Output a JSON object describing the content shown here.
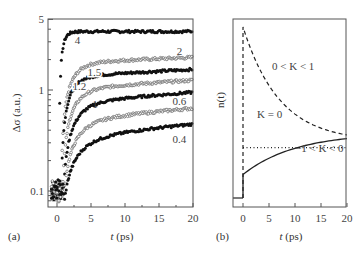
{
  "chart_data": [
    {
      "panel": "(a)",
      "type": "scatter",
      "xlabel": "t (ps)",
      "ylabel": "Δσ (a.u.)",
      "yscale": "log",
      "xlim": [
        -1,
        20
      ],
      "ylim": [
        0.07,
        5
      ],
      "xticks": [
        0,
        5,
        10,
        15,
        20
      ],
      "yticks": [
        {
          "value": 0.1,
          "label": "0.1"
        },
        {
          "value": 1,
          "label": "1"
        },
        {
          "value": 5,
          "label": "5"
        }
      ],
      "grid": false,
      "legend": "inline curve labels (pump fluence)",
      "series": [
        {
          "name": "4",
          "marker": "filled",
          "plateau": 3.8,
          "rise_tau": 0.5,
          "onset": 0.3,
          "label_pos": [
            3,
            3.1
          ]
        },
        {
          "name": "2",
          "marker": "open",
          "plateau": 2.1,
          "rise_tau": 1.6,
          "onset": 0.6,
          "slope": 0.006,
          "label_pos": [
            18,
            2.45
          ]
        },
        {
          "name": "1.5",
          "marker": "filled",
          "plateau": 1.6,
          "rise_tau": 1.4,
          "onset": 0.6,
          "slope": 0.008,
          "label_pos": [
            5.5,
            1.5
          ]
        },
        {
          "name": "1.2",
          "marker": "open",
          "plateau": 1.25,
          "rise_tau": 1.8,
          "onset": 0.8,
          "slope": 0.01,
          "label_pos": [
            3.3,
            1.1
          ]
        },
        {
          "name": "1",
          "marker": "filled",
          "plateau": 0.95,
          "rise_tau": 2.0,
          "onset": 0.9,
          "slope": 0.012,
          "label_pos": [
            5.6,
            0.72
          ]
        },
        {
          "name": "0.6",
          "marker": "open",
          "plateau": 0.66,
          "rise_tau": 2.2,
          "onset": 1.0,
          "slope": 0.014,
          "label_pos": [
            18,
            0.78
          ]
        },
        {
          "name": "0.4",
          "marker": "filled",
          "plateau": 0.46,
          "rise_tau": 2.4,
          "onset": 1.1,
          "slope": 0.016,
          "label_pos": [
            18,
            0.33
          ]
        }
      ]
    },
    {
      "panel": "(b)",
      "type": "line",
      "xlabel": "t (ps)",
      "ylabel": "n(t)",
      "xlim": [
        -2,
        20
      ],
      "xticks": [
        0,
        5,
        10,
        15,
        20
      ],
      "yticks": [],
      "grid": false,
      "baseline": 0.05,
      "series": [
        {
          "name": "0 < K < 1",
          "style": "dashed",
          "start": 1.0,
          "end": 0.4,
          "tau": 7,
          "label_pos": [
            11,
            0.78
          ]
        },
        {
          "name": "K = 0",
          "style": "dotted",
          "start": 0.33,
          "end": 0.33,
          "label_pos": [
            2.5,
            0.37
          ]
        },
        {
          "name": "−1 < K < 0",
          "style": "solid",
          "start": 0.18,
          "end": 0.38,
          "tau": 10,
          "label_pos": [
            10,
            0.22
          ]
        }
      ]
    }
  ],
  "labels": {
    "panel_a": "(a)",
    "panel_b": "(b)",
    "xlabel_a_var": "t",
    "xlabel_a_unit": " (ps)",
    "xlabel_b_var": "t",
    "xlabel_b_unit": " (ps)",
    "ylabel_a": "Δσ (a.u.)",
    "ylabel_b": "n(t)",
    "k_between_0_1": "0 < K < 1",
    "k_zero": "K = 0",
    "k_neg": "−1 < K < 0"
  }
}
